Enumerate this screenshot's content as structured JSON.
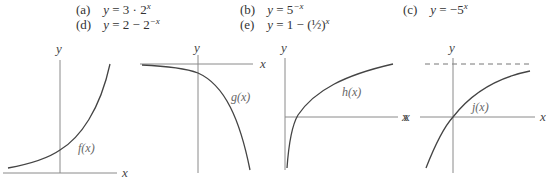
{
  "options": [
    {
      "label": "(a)",
      "equation": "y = 3 · 2^x"
    },
    {
      "label": "(b)",
      "equation": "y = 5^−x"
    },
    {
      "label": "(c)",
      "equation": "y = −5^x"
    },
    {
      "label": "(d)",
      "equation": "y = 2 − 2^−x"
    },
    {
      "label": "(e)",
      "equation": "y = 1 − (½)^x"
    }
  ],
  "graphs": [
    {
      "function_label": "f(x)",
      "x_label": "x",
      "y_label": "y",
      "shape": "increasing exponential growth, above x-axis"
    },
    {
      "function_label": "g(x)",
      "x_label": "x",
      "y_label": "y",
      "shape": "decreasing, below x-axis, approaches 0 from below on the left"
    },
    {
      "function_label": "h(x)",
      "x_label": "x",
      "y_label": "y",
      "shape": "increasing, concave down, vertical asymptote near y-axis"
    },
    {
      "function_label": "j(x)",
      "x_label": "x",
      "y_label": "y",
      "left_x_label": "x",
      "shape": "increasing, passes through origin, horizontal dashed asymptote above"
    }
  ],
  "text": {
    "a_label": "(a)",
    "a_pre": "y",
    "a_mid": " = 3 · 2",
    "a_exp": "x",
    "b_label": "(b)",
    "b_pre": "y",
    "b_mid": " = 5",
    "b_exp": "−x",
    "c_label": "(c)",
    "c_pre": "y",
    "c_mid": " = −5",
    "c_exp": "x",
    "d_label": "(d)",
    "d_pre": "y",
    "d_mid": " = 2 − 2",
    "d_exp": "−x",
    "e_label": "(e)",
    "e_pre": "y",
    "e_mid": " = 1 − (½)",
    "e_exp": "x",
    "x": "x",
    "y": "y",
    "f": "f(x)",
    "g": "g(x)",
    "h": "h(x)",
    "j": "j(x)"
  }
}
